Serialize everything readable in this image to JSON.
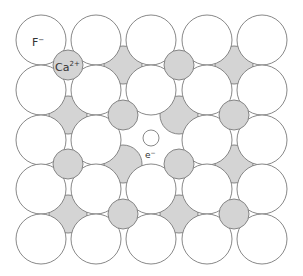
{
  "labels": {
    "anion": "F",
    "anion_charge": "−",
    "cation": "Ca",
    "cation_charge": "2+",
    "electron": "e",
    "electron_charge": "−"
  },
  "lattice": {
    "anion_cols": [
      41,
      96,
      151,
      207,
      262
    ],
    "anion_rows": [
      40,
      90,
      140,
      189,
      239
    ],
    "anion_radius": 25,
    "vacancy": {
      "row": 2,
      "col": 2
    },
    "cation_cols": [
      68,
      123,
      179,
      234
    ],
    "cation_rows": [
      65,
      115,
      164,
      214
    ],
    "cation_radius": 15,
    "cation_on_top_pattern": "checkerboard (row+col even)"
  },
  "electron": {
    "cx": 151,
    "cy": 138,
    "r": 8
  },
  "colors": {
    "anion_fill": "#ffffff",
    "cation_fill": "#d4d4d4",
    "outline": "#7a7a7a",
    "text": "#333333"
  }
}
